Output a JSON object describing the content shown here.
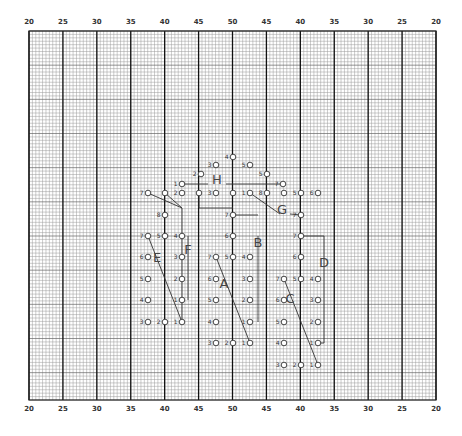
{
  "diagram": {
    "type": "graph-paper-layout",
    "grid": {
      "left": 29,
      "top": 31,
      "right": 436,
      "bottom": 400,
      "major_cols": 12,
      "minor_per_major": 10,
      "minor_rows": 108
    },
    "top_scale": [
      "20",
      "25",
      "30",
      "35",
      "40",
      "45",
      "50",
      "45",
      "40",
      "35",
      "30",
      "25",
      "20"
    ],
    "bottom_scale": [
      "20",
      "25",
      "30",
      "35",
      "40",
      "45",
      "50",
      "45",
      "40",
      "35",
      "30",
      "25",
      "20"
    ],
    "components": [
      {
        "id": "A",
        "label": "A",
        "x": 224,
        "y": 288
      },
      {
        "id": "B",
        "label": "B",
        "x": 258,
        "y": 247
      },
      {
        "id": "C",
        "label": "C",
        "x": 290,
        "y": 303
      },
      {
        "id": "D",
        "label": "D",
        "x": 324,
        "y": 267
      },
      {
        "id": "E",
        "label": "E",
        "x": 157,
        "y": 262
      },
      {
        "id": "F",
        "label": "F",
        "x": 188,
        "y": 254
      },
      {
        "id": "G",
        "label": "G",
        "x": 282,
        "y": 214
      },
      {
        "id": "H",
        "label": "H",
        "x": 217,
        "y": 184
      }
    ],
    "pins": [
      {
        "g": "top",
        "n": "4",
        "x": 233,
        "y": 157
      },
      {
        "g": "top",
        "n": "3",
        "x": 216,
        "y": 165
      },
      {
        "g": "top",
        "n": "5",
        "x": 250,
        "y": 165
      },
      {
        "g": "top",
        "n": "2",
        "x": 201,
        "y": 174
      },
      {
        "g": "top",
        "n": "5",
        "x": 267,
        "y": 174
      },
      {
        "g": "top",
        "n": "1",
        "x": 182,
        "y": 184
      },
      {
        "g": "top",
        "n": "7",
        "x": 283,
        "y": 184
      },
      {
        "g": "row",
        "n": "7",
        "x": 148,
        "y": 193
      },
      {
        "g": "row",
        "n": "",
        "x": 165,
        "y": 193
      },
      {
        "g": "row",
        "n": "2",
        "x": 182,
        "y": 193
      },
      {
        "g": "row",
        "n": "",
        "x": 199,
        "y": 193
      },
      {
        "g": "row",
        "n": "3",
        "x": 216,
        "y": 193
      },
      {
        "g": "row",
        "n": "",
        "x": 233,
        "y": 193
      },
      {
        "g": "row",
        "n": "1",
        "x": 250,
        "y": 193
      },
      {
        "g": "row",
        "n": "8",
        "x": 267,
        "y": 193
      },
      {
        "g": "row",
        "n": "",
        "x": 284,
        "y": 193
      },
      {
        "g": "row",
        "n": "5",
        "x": 301,
        "y": 193
      },
      {
        "g": "row",
        "n": "6",
        "x": 318,
        "y": 193
      },
      {
        "g": "E",
        "n": "8",
        "x": 165,
        "y": 215
      },
      {
        "g": "E",
        "n": "7",
        "x": 148,
        "y": 236
      },
      {
        "g": "E",
        "n": "6",
        "x": 148,
        "y": 257
      },
      {
        "g": "E",
        "n": "5",
        "x": 148,
        "y": 279
      },
      {
        "g": "E",
        "n": "4",
        "x": 148,
        "y": 300
      },
      {
        "g": "E",
        "n": "3",
        "x": 148,
        "y": 322
      },
      {
        "g": "E",
        "n": "5",
        "x": 165,
        "y": 236
      },
      {
        "g": "E",
        "n": "2",
        "x": 165,
        "y": 322
      },
      {
        "g": "F",
        "n": "4",
        "x": 182,
        "y": 236
      },
      {
        "g": "F",
        "n": "3",
        "x": 182,
        "y": 257
      },
      {
        "g": "F",
        "n": "2",
        "x": 182,
        "y": 279
      },
      {
        "g": "F",
        "n": "1",
        "x": 182,
        "y": 300
      },
      {
        "g": "F",
        "n": "1",
        "x": 182,
        "y": 322
      },
      {
        "g": "B",
        "n": "7",
        "x": 233,
        "y": 215
      },
      {
        "g": "B",
        "n": "6",
        "x": 233,
        "y": 236
      },
      {
        "g": "A",
        "n": "7",
        "x": 216,
        "y": 257
      },
      {
        "g": "A",
        "n": "6",
        "x": 216,
        "y": 279
      },
      {
        "g": "A",
        "n": "5",
        "x": 216,
        "y": 300
      },
      {
        "g": "A",
        "n": "4",
        "x": 216,
        "y": 322
      },
      {
        "g": "A",
        "n": "3",
        "x": 216,
        "y": 343
      },
      {
        "g": "A",
        "n": "5",
        "x": 233,
        "y": 257
      },
      {
        "g": "A",
        "n": "2",
        "x": 233,
        "y": 343
      },
      {
        "g": "B",
        "n": "4",
        "x": 250,
        "y": 257
      },
      {
        "g": "B",
        "n": "3",
        "x": 250,
        "y": 279
      },
      {
        "g": "B",
        "n": "2",
        "x": 250,
        "y": 300
      },
      {
        "g": "B",
        "n": "1",
        "x": 250,
        "y": 322
      },
      {
        "g": "A",
        "n": "1",
        "x": 250,
        "y": 343
      },
      {
        "g": "G",
        "n": "7",
        "x": 301,
        "y": 215
      },
      {
        "g": "D",
        "n": "7",
        "x": 301,
        "y": 236
      },
      {
        "g": "D",
        "n": "6",
        "x": 301,
        "y": 257
      },
      {
        "g": "C",
        "n": "7",
        "x": 284,
        "y": 279
      },
      {
        "g": "C",
        "n": "6",
        "x": 284,
        "y": 300
      },
      {
        "g": "C",
        "n": "5",
        "x": 284,
        "y": 322
      },
      {
        "g": "C",
        "n": "4",
        "x": 284,
        "y": 343
      },
      {
        "g": "C",
        "n": "3",
        "x": 284,
        "y": 365
      },
      {
        "g": "C",
        "n": "5",
        "x": 301,
        "y": 279
      },
      {
        "g": "C",
        "n": "2",
        "x": 301,
        "y": 365
      },
      {
        "g": "C",
        "n": "4",
        "x": 318,
        "y": 279
      },
      {
        "g": "C",
        "n": "3",
        "x": 318,
        "y": 300
      },
      {
        "g": "C",
        "n": "2",
        "x": 318,
        "y": 322
      },
      {
        "g": "D",
        "n": "1",
        "x": 318,
        "y": 343
      },
      {
        "g": "C",
        "n": "1",
        "x": 318,
        "y": 365
      }
    ],
    "wires": [
      [
        148,
        193,
        182,
        208
      ],
      [
        165,
        193,
        182,
        208
      ],
      [
        182,
        208,
        182,
        322
      ],
      [
        199,
        193,
        199,
        208
      ],
      [
        199,
        208,
        233,
        208
      ],
      [
        182,
        184,
        208,
        184
      ],
      [
        226,
        184,
        283,
        184
      ],
      [
        250,
        193,
        280,
        214
      ],
      [
        290,
        214,
        301,
        215
      ],
      [
        148,
        236,
        182,
        322
      ],
      [
        188,
        236,
        188,
        300
      ],
      [
        216,
        257,
        250,
        343
      ],
      [
        258,
        236,
        258,
        322
      ],
      [
        233,
        215,
        258,
        215
      ],
      [
        301,
        236,
        324,
        236
      ],
      [
        324,
        236,
        324,
        343
      ],
      [
        318,
        343,
        324,
        343
      ],
      [
        284,
        279,
        318,
        365
      ]
    ]
  }
}
